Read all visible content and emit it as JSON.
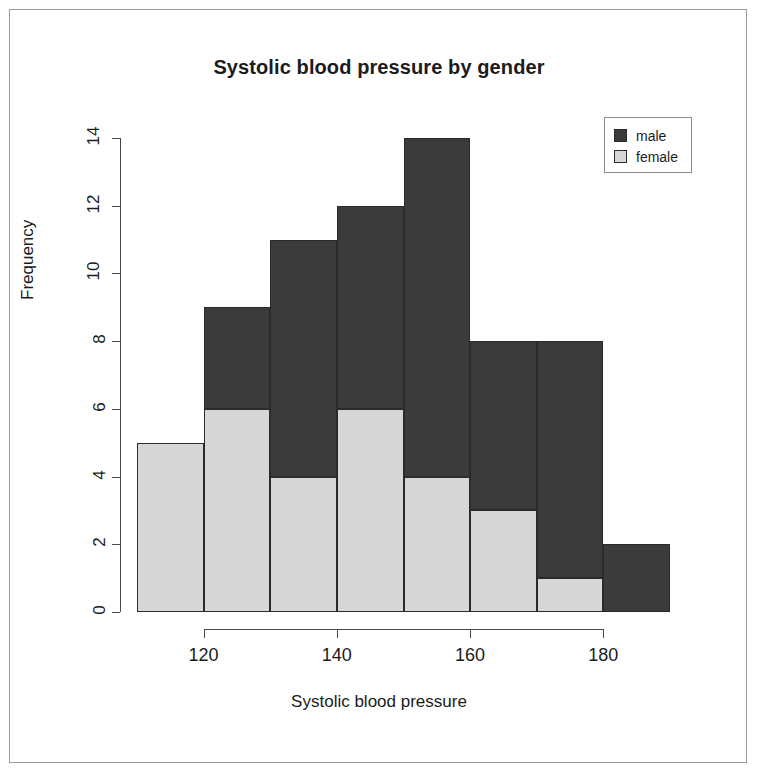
{
  "chart_data": {
    "type": "bar",
    "subtype": "stacked-histogram",
    "title": "Systolic blood pressure by gender",
    "xlabel": "Systolic blood pressure",
    "ylabel": "Frequency",
    "xlim": [
      110,
      190
    ],
    "ylim": [
      0,
      14
    ],
    "bin_width": 10,
    "grid": false,
    "legend_position": "top-right",
    "categories": [
      "110-120",
      "120-130",
      "130-140",
      "140-150",
      "150-160",
      "160-170",
      "170-180",
      "180-190"
    ],
    "bin_starts": [
      110,
      120,
      130,
      140,
      150,
      160,
      170,
      180
    ],
    "bin_ends": [
      120,
      130,
      140,
      150,
      160,
      170,
      180,
      190
    ],
    "series": [
      {
        "name": "female",
        "color": "#d7d7d7",
        "values": [
          5,
          6,
          4,
          6,
          4,
          3,
          1,
          0
        ]
      },
      {
        "name": "male",
        "color": "#3b3b3b",
        "values": [
          0,
          3,
          7,
          6,
          10,
          5,
          7,
          2
        ]
      }
    ],
    "totals": [
      5,
      9,
      11,
      12,
      14,
      8,
      8,
      2
    ],
    "x_ticks": [
      120,
      140,
      160,
      180
    ],
    "x_tick_labels": [
      "120",
      "140",
      "160",
      "180"
    ],
    "y_ticks": [
      0,
      2,
      4,
      6,
      8,
      10,
      12,
      14
    ],
    "y_tick_labels": [
      "0",
      "2",
      "4",
      "6",
      "8",
      "10",
      "12",
      "14"
    ]
  },
  "legend": {
    "items": [
      {
        "label": "male",
        "color": "#3b3b3b"
      },
      {
        "label": "female",
        "color": "#d7d7d7"
      }
    ]
  },
  "colors": {
    "male": "#3b3b3b",
    "female": "#d7d7d7",
    "axis": "#4a4a4a",
    "text": "#1b1b1b",
    "frame": "#9a9a9a",
    "background": "#ffffff"
  }
}
